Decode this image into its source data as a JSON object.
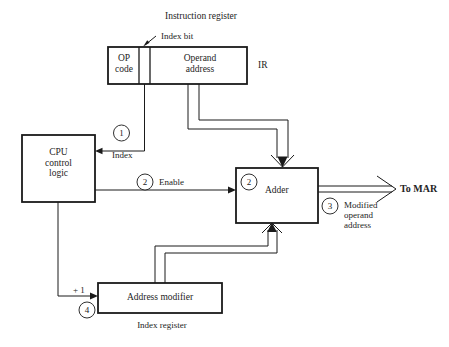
{
  "figure": {
    "title": "Instruction register",
    "type": "block-diagram"
  },
  "blocks": {
    "op_code": "OP\ncode",
    "operand_address": "Operand\naddress",
    "ir_label": "IR",
    "cpu": "CPU\ncontrol\nlogic",
    "adder": "Adder",
    "address_modifier": "Address modifier",
    "index_register_caption": "Index register"
  },
  "annotations": {
    "index_bit": "Index bit",
    "index": "Index",
    "enable": "Enable",
    "plus_one": "+ 1",
    "to_mar": "To MAR",
    "modified_operand_address": "Modified\noperand\naddress"
  },
  "step_markers": {
    "one": "1",
    "two_enable": "2",
    "two_adder": "2",
    "three": "3",
    "four": "4"
  },
  "colors": {
    "background": "#ffffff",
    "ink": "#1a1a1a",
    "text": "#242424"
  }
}
